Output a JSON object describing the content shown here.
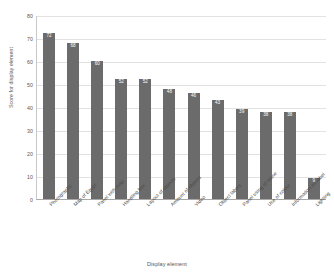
{
  "chart_data": {
    "type": "bar",
    "title": "",
    "xlabel": "Display element",
    "ylabel": "Score for display element",
    "ylim": [
      0,
      80
    ],
    "yticks": [
      0,
      10,
      20,
      30,
      40,
      50,
      60,
      70,
      80
    ],
    "grid": true,
    "legend": "none",
    "bar_color": "#6b6b6b",
    "value_label_color": "#ffffff",
    "categories": [
      "Photographs",
      "Map of Egypt",
      "Panel with map",
      "Handling box",
      "Layout of objects",
      "Amount of objects",
      "Video",
      "Object labels",
      "Panel using of stone",
      "Use of colour",
      "Information on label",
      "Lighting"
    ],
    "values": [
      72,
      68,
      60,
      52,
      52,
      48,
      46,
      43,
      39,
      38,
      38,
      9
    ]
  }
}
